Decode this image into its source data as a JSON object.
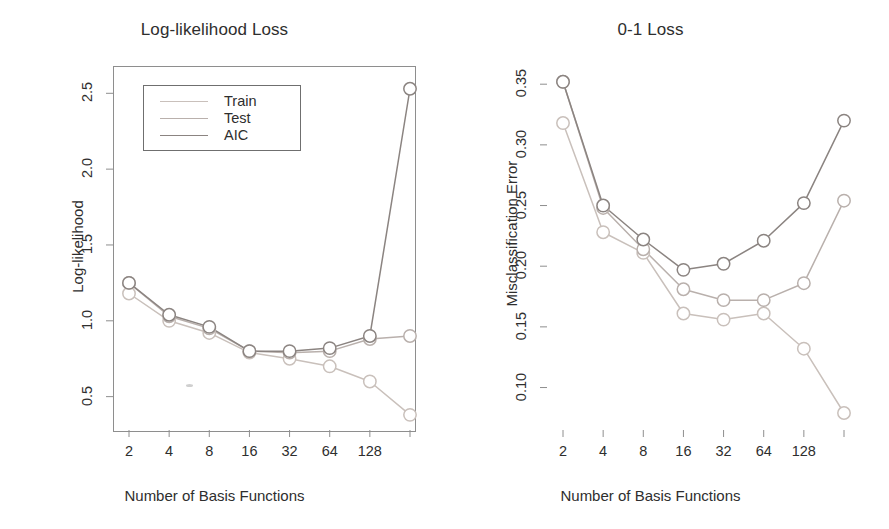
{
  "figure": {
    "background": "#ffffff",
    "axis_color": "#8e8e8e",
    "text_color": "#2e2e2e"
  },
  "series_colors": {
    "Train": "#c9c0bb",
    "Test": "#b9b0ac",
    "AIC": "#8b8481"
  },
  "legend": {
    "items": [
      {
        "label": "Train",
        "color": "#c9c0bb"
      },
      {
        "label": "Test",
        "color": "#b9b0ac"
      },
      {
        "label": "AIC",
        "color": "#8b8481"
      }
    ]
  },
  "panels": {
    "left": {
      "title": "Log-likelihood Loss",
      "xlabel": "Number of Basis Functions",
      "ylabel": "Log-likelihood",
      "yticks": [
        "0.5",
        "1.0",
        "1.5",
        "2.0",
        "2.5"
      ],
      "xticks": [
        "2",
        "4",
        "8",
        "16",
        "32",
        "64",
        "128",
        ""
      ]
    },
    "right": {
      "title": "0-1 Loss",
      "xlabel": "Number of Basis Functions",
      "ylabel": "Misclassification Error",
      "yticks": [
        "0.10",
        "0.15",
        "0.20",
        "0.25",
        "0.30",
        "0.35"
      ],
      "xticks": [
        "2",
        "4",
        "8",
        "16",
        "32",
        "64",
        "128",
        ""
      ]
    }
  },
  "chart_data": [
    {
      "type": "line",
      "panel": "left",
      "title": "Log-likelihood Loss",
      "xlabel": "Number of Basis Functions",
      "ylabel": "Log-likelihood",
      "categories": [
        "2",
        "4",
        "8",
        "16",
        "32",
        "64",
        "128",
        "256"
      ],
      "x_is_log2": true,
      "ylim": [
        0.28,
        2.68
      ],
      "yticks": [
        0.5,
        1.0,
        1.5,
        2.0,
        2.5
      ],
      "grid": false,
      "legend_position": "top-left",
      "marker": "open-circle",
      "series": [
        {
          "name": "Train",
          "color": "#c9c0bb",
          "values": [
            1.18,
            1.0,
            0.92,
            0.79,
            0.75,
            0.7,
            0.6,
            0.38
          ]
        },
        {
          "name": "Test",
          "color": "#b9b0ac",
          "values": [
            1.25,
            1.03,
            0.95,
            0.8,
            0.79,
            0.8,
            0.88,
            0.9
          ]
        },
        {
          "name": "AIC",
          "color": "#8b8481",
          "values": [
            1.25,
            1.04,
            0.96,
            0.8,
            0.8,
            0.82,
            0.9,
            2.53
          ]
        }
      ]
    },
    {
      "type": "line",
      "panel": "right",
      "title": "0-1 Loss",
      "xlabel": "Number of Basis Functions",
      "ylabel": "Misclassification Error",
      "categories": [
        "2",
        "4",
        "8",
        "16",
        "32",
        "64",
        "128",
        "256"
      ],
      "x_is_log2": true,
      "ylim": [
        0.065,
        0.365
      ],
      "yticks": [
        0.1,
        0.15,
        0.2,
        0.25,
        0.3,
        0.35
      ],
      "grid": false,
      "legend_position": "none",
      "marker": "open-circle",
      "series": [
        {
          "name": "Train",
          "color": "#c9c0bb",
          "values": [
            0.318,
            0.228,
            0.211,
            0.161,
            0.156,
            0.161,
            0.132,
            0.079
          ]
        },
        {
          "name": "Test",
          "color": "#b9b0ac",
          "values": [
            0.352,
            0.248,
            0.214,
            0.181,
            0.172,
            0.172,
            0.186,
            0.254
          ]
        },
        {
          "name": "AIC",
          "color": "#8b8481",
          "values": [
            0.352,
            0.25,
            0.222,
            0.197,
            0.202,
            0.221,
            0.252,
            0.32
          ]
        }
      ]
    }
  ]
}
